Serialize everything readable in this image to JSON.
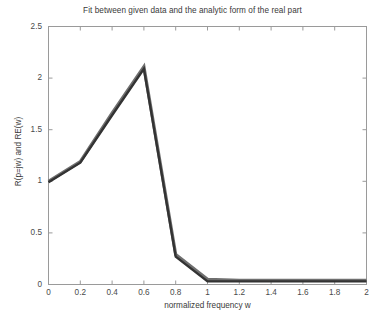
{
  "chart_data": {
    "type": "line",
    "title": "Fit between given data and the analytic form of the real part",
    "xlabel": "normalized frequency w",
    "ylabel": "R(p=jw) and RE(w)",
    "xlim": [
      0,
      2
    ],
    "ylim": [
      0,
      2.5
    ],
    "grid": false,
    "legend": "none",
    "xticks": [
      "0",
      "0.2",
      "0.4",
      "0.6",
      "0.8",
      "1",
      "1.2",
      "1.4",
      "1.6",
      "1.8",
      "2"
    ],
    "xtick_values": [
      0,
      0.2,
      0.4,
      0.6,
      0.8,
      1,
      1.2,
      1.4,
      1.6,
      1.8,
      2
    ],
    "yticks": [
      "0",
      "0.5",
      "1",
      "1.5",
      "2",
      "2.5"
    ],
    "ytick_values": [
      0,
      0.5,
      1,
      1.5,
      2,
      2.5
    ],
    "x": [
      0,
      0.2,
      0.4,
      0.6,
      0.8,
      1,
      1.2,
      1.4,
      1.6,
      1.8,
      2
    ],
    "series": [
      {
        "name": "given data",
        "color": "#6f6f6f",
        "width": 3.2,
        "values": [
          1.0,
          1.19,
          1.66,
          2.11,
          0.29,
          0.05,
          0.04,
          0.04,
          0.04,
          0.04,
          0.04
        ]
      },
      {
        "name": "analytic form RE(w)",
        "color": "#333333",
        "width": 2.4,
        "values": [
          0.99,
          1.18,
          1.64,
          2.09,
          0.27,
          0.03,
          0.03,
          0.03,
          0.03,
          0.03,
          0.03
        ]
      }
    ]
  },
  "axes": {
    "frame_color": "#9a9a9a",
    "background": "#ffffff",
    "tick_color": "#9a9a9a",
    "text_color": "#3a3a3a"
  }
}
